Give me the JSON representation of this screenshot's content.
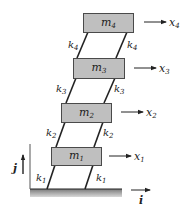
{
  "diagram": {
    "type": "four-story shear building spring-mass model",
    "colors": {
      "mass_fill": "#bfbfbf",
      "mass_stroke": "#4a4a4a",
      "line": "#222222",
      "ground_fill": "#9a9a9a"
    },
    "masses": [
      {
        "id": "m1",
        "base": "m",
        "sub": "1",
        "x": 51,
        "y": 147,
        "w": 50,
        "h": 18
      },
      {
        "id": "m2",
        "base": "m",
        "sub": "2",
        "x": 61,
        "y": 103,
        "w": 50,
        "h": 19
      },
      {
        "id": "m3",
        "base": "m",
        "sub": "3",
        "x": 73,
        "y": 58,
        "w": 51,
        "h": 20
      },
      {
        "id": "m4",
        "base": "m",
        "sub": "4",
        "x": 83,
        "y": 13,
        "w": 50,
        "h": 19
      }
    ],
    "springs": [
      {
        "id": "k1",
        "base": "k",
        "sub": "1",
        "left": {
          "x1": 55,
          "y1": 165,
          "x2": 47,
          "y2": 189
        },
        "right": {
          "x1": 93,
          "y1": 165,
          "x2": 85,
          "y2": 189
        },
        "label_left": {
          "x": 36,
          "y": 181
        },
        "label_right": {
          "x": 96,
          "y": 181
        }
      },
      {
        "id": "k2",
        "base": "k",
        "sub": "2",
        "left": {
          "x1": 65,
          "y1": 122,
          "x2": 56,
          "y2": 147
        },
        "right": {
          "x1": 103,
          "y1": 122,
          "x2": 94,
          "y2": 147
        },
        "label_left": {
          "x": 46,
          "y": 136
        },
        "label_right": {
          "x": 103,
          "y": 136
        }
      },
      {
        "id": "k3",
        "base": "k",
        "sub": "3",
        "left": {
          "x1": 76,
          "y1": 78,
          "x2": 66,
          "y2": 103
        },
        "right": {
          "x1": 115,
          "y1": 78,
          "x2": 104,
          "y2": 103
        },
        "label_left": {
          "x": 56,
          "y": 92
        },
        "label_right": {
          "x": 114,
          "y": 92
        }
      },
      {
        "id": "k4",
        "base": "k",
        "sub": "4",
        "left": {
          "x1": 88,
          "y1": 32,
          "x2": 77,
          "y2": 58
        },
        "right": {
          "x1": 127,
          "y1": 32,
          "x2": 116,
          "y2": 58
        },
        "label_left": {
          "x": 68,
          "y": 48
        },
        "label_right": {
          "x": 127,
          "y": 48
        }
      }
    ],
    "displacements": [
      {
        "id": "x1",
        "base": "x",
        "sub": "1",
        "x1": 109,
        "x2": 131,
        "y": 156,
        "label_x": 134
      },
      {
        "id": "x2",
        "base": "x",
        "sub": "2",
        "x1": 121,
        "x2": 143,
        "y": 112,
        "label_x": 146
      },
      {
        "id": "x3",
        "base": "x",
        "sub": "3",
        "x1": 134,
        "x2": 156,
        "y": 68,
        "label_x": 159
      },
      {
        "id": "x4",
        "base": "x",
        "sub": "4",
        "x1": 144,
        "x2": 166,
        "y": 22,
        "label_x": 169
      }
    ],
    "ground": {
      "x": 30,
      "y": 189,
      "w": 92,
      "h": 8
    },
    "wall": {
      "x": 30,
      "y1": 144,
      "y2": 189
    },
    "axes": {
      "i": {
        "label": "i",
        "x1": 131,
        "x2": 150,
        "y": 190,
        "label_x": 139,
        "label_y": 204
      },
      "j": {
        "label": "j",
        "x": 23,
        "y1": 174,
        "y2": 155,
        "label_x": 13,
        "label_y": 172
      }
    }
  }
}
